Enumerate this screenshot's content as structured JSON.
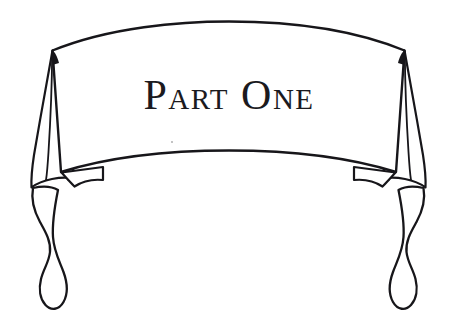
{
  "page": {
    "kind": "decorative-illustration",
    "background_color": "#ffffff",
    "ink_color": "#17161a",
    "width": 458,
    "height": 335
  },
  "banner": {
    "title": "Part One",
    "title_display": "PART ONE",
    "title_style": "small-caps serif",
    "title_color": "#1b1a1e",
    "shape_name": "ribbon-scroll-banner",
    "description": "Hand-drawn ribbon banner with arched top and bottom edges, draped side panels and curled tails",
    "parts": [
      {
        "name": "banner-front-panel",
        "label": "Banner front panel"
      },
      {
        "name": "left-drape-panel",
        "label": "Left drape panel"
      },
      {
        "name": "right-drape-panel",
        "label": "Right drape panel"
      },
      {
        "name": "left-fold-notch",
        "label": "Left fold notch"
      },
      {
        "name": "right-fold-notch",
        "label": "Right fold notch"
      },
      {
        "name": "left-ribbon-tail",
        "label": "Left ribbon tail"
      },
      {
        "name": "right-ribbon-tail",
        "label": "Right ribbon tail"
      }
    ]
  }
}
